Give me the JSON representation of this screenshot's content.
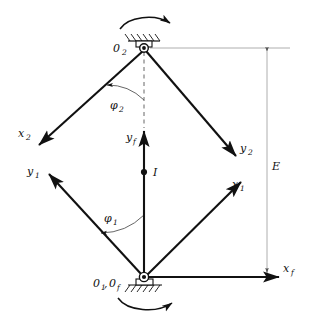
{
  "diagram": {
    "type": "mechanism-kinematic-diagram",
    "background_color": "#ffffff",
    "line_color": "#111111",
    "thin_line_color": "#8a8a8a",
    "nodes": {
      "top_pivot": {
        "name": "O2",
        "label": "0",
        "subscript": "2",
        "x": 143,
        "y": 48
      },
      "bottom_pivot": {
        "name": "O1_Of",
        "label_a": "0",
        "subscript_a": "1",
        "separator": ",",
        "label_b": "0",
        "subscript_b": "f",
        "x": 144,
        "y": 277
      },
      "point_I": {
        "label": "I",
        "x": 144,
        "y": 172
      }
    },
    "labels": {
      "o2": {
        "base": "0",
        "sub": "2"
      },
      "o1of": {
        "base1": "0",
        "sub1": "1",
        "comma": ",",
        "base2": "0",
        "sub2": "f"
      },
      "x2": {
        "base": "x",
        "sub": "2"
      },
      "y2": {
        "base": "y",
        "sub": "2"
      },
      "x1": {
        "base": "x",
        "sub": "1"
      },
      "y1": {
        "base": "y",
        "sub": "1"
      },
      "xf": {
        "base": "x",
        "sub": "f"
      },
      "yf": {
        "base": "y",
        "sub": "f"
      },
      "phi1": {
        "base": "φ",
        "sub": "1"
      },
      "phi2": {
        "base": "φ",
        "sub": "2"
      },
      "point_i": {
        "base": "I"
      },
      "dimension_e": {
        "base": "E"
      }
    },
    "links": [
      {
        "name": "upper-left-link",
        "from": "top_pivot",
        "to_label": "x2",
        "x1": 143,
        "y1": 50,
        "x2": 37,
        "y2": 146,
        "arrow": true
      },
      {
        "name": "upper-right-link",
        "from": "top_pivot",
        "to_label": "y2",
        "x1": 145,
        "y1": 50,
        "x2": 238,
        "y2": 158,
        "arrow": true
      },
      {
        "name": "lower-left-link",
        "from": "bottom_pivot",
        "to_label": "y1",
        "x1": 143,
        "y1": 275,
        "x2": 47,
        "y2": 172,
        "arrow": true
      },
      {
        "name": "lower-right-link",
        "from": "bottom_pivot",
        "to_label": "x1",
        "x1": 146,
        "y1": 275,
        "x2": 243,
        "y2": 180,
        "arrow": true
      }
    ],
    "axes": [
      {
        "name": "yf-axis",
        "label": "yf",
        "orientation": "vertical",
        "x1": 144,
        "y1": 276,
        "x2": 144,
        "y2": 128,
        "arrow": true
      },
      {
        "name": "xf-axis",
        "label": "xf",
        "orientation": "horizontal",
        "x1": 146,
        "y1": 277,
        "x2": 282,
        "y2": 277,
        "arrow": true
      }
    ],
    "dimension": {
      "name": "E",
      "label": "E",
      "x": 267,
      "y_top": 48,
      "y_bottom": 277,
      "arrows": "double"
    },
    "angles": [
      {
        "name": "phi2",
        "label": "φ2",
        "vertex": "top_pivot",
        "from_ray": "vertical-down",
        "to_ray": "upper-left-link",
        "radius": 52
      },
      {
        "name": "phi1",
        "label": "φ1",
        "vertex": "bottom_pivot",
        "from_ray": "vertical-up",
        "to_ray": "lower-left-link",
        "radius": 62
      }
    ],
    "supports": [
      {
        "name": "top-ground-support",
        "type": "hatched-fixed-support",
        "x": 143,
        "y": 44,
        "orientation": "above"
      },
      {
        "name": "bottom-ground-support",
        "type": "hatched-fixed-support",
        "x": 144,
        "y": 281,
        "orientation": "below"
      }
    ],
    "rotation_arrows": [
      {
        "name": "top-rotation-arrow",
        "direction": "clockwise",
        "cx": 146,
        "cy": 27
      },
      {
        "name": "bottom-rotation-arrow",
        "direction": "clockwise",
        "cx": 150,
        "cy": 301
      }
    ]
  }
}
